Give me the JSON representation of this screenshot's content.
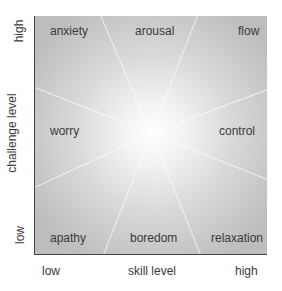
{
  "diagram": {
    "type": "flow-channel-quadrant",
    "x_axis": {
      "title": "skill level",
      "low": "low",
      "high": "high"
    },
    "y_axis": {
      "title": "challenge level",
      "low": "low",
      "high": "high"
    },
    "regions": {
      "top_left": "anxiety",
      "top_center": "arousal",
      "top_right": "flow",
      "middle_left": "worry",
      "middle_right": "control",
      "bottom_left": "apathy",
      "bottom_center": "boredom",
      "bottom_right": "relaxation"
    },
    "colors": {
      "background_edge": "#bdbdbd",
      "background_center": "#ffffff",
      "axis_line": "#444444",
      "text": "#3a3a3a"
    }
  }
}
